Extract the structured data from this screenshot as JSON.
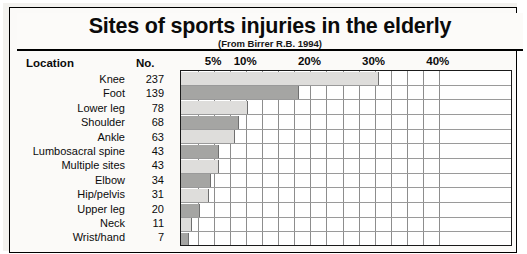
{
  "header": {
    "title": "Sites of sports injuries in the elderly",
    "subtitle": "(From Birrer R.B. 1994)"
  },
  "table": {
    "columns": [
      "Location",
      "No."
    ]
  },
  "chart_data": {
    "type": "bar",
    "orientation": "horizontal",
    "title": "Sites of sports injuries in the elderly",
    "subtitle": "(From Birrer R.B. 1994)",
    "xlabel": "",
    "ylabel": "Location",
    "categories": [
      "Knee",
      "Foot",
      "Lower leg",
      "Shoulder",
      "Ankle",
      "Lumbosacral spine",
      "Multiple sites",
      "Elbow",
      "Hip/pelvis",
      "Upper leg",
      "Neck",
      "Wrist/hand"
    ],
    "values": [
      237,
      139,
      78,
      68,
      63,
      43,
      43,
      34,
      31,
      20,
      11,
      7
    ],
    "percents": [
      30.6,
      18.0,
      10.1,
      8.8,
      8.1,
      5.6,
      5.6,
      4.4,
      4.0,
      2.6,
      1.4,
      0.9
    ],
    "total": 774,
    "xlim": [
      0,
      41.5
    ],
    "tick_labels": [
      "5%",
      "10%",
      "20%",
      "30%",
      "40%"
    ],
    "tick_values": [
      5,
      10,
      20,
      30,
      40
    ],
    "grid": true,
    "grid_step_percent": 2.5,
    "legend": "none",
    "bar_colors": [
      "#dedddb",
      "#a5a5a3"
    ]
  }
}
